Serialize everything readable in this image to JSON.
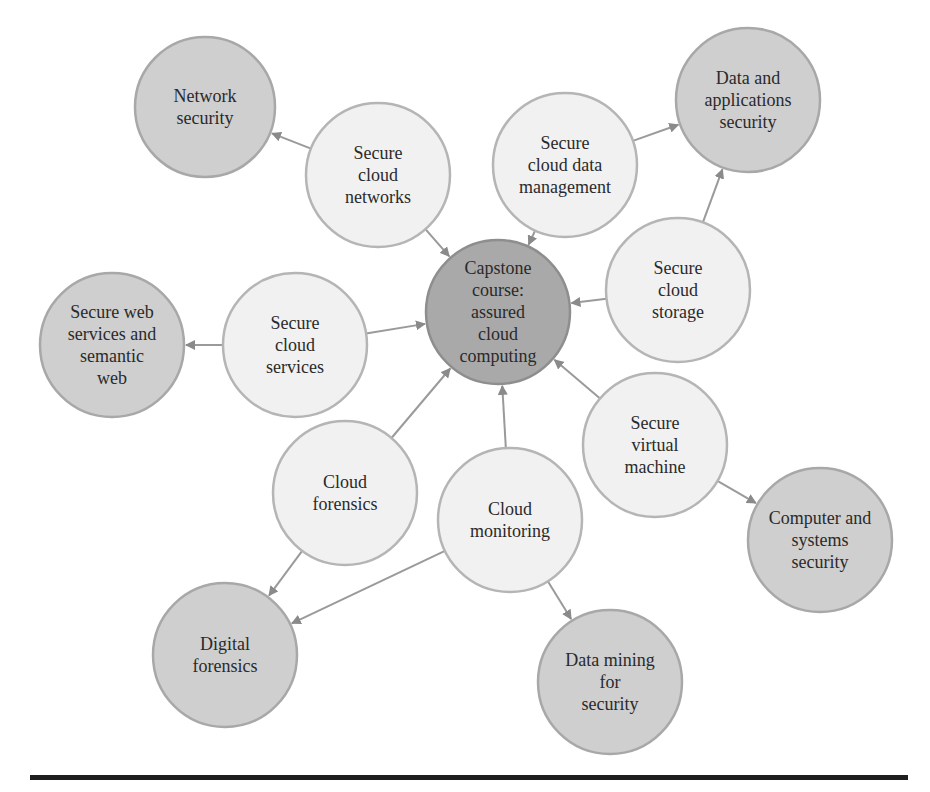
{
  "colors": {
    "center_fill": "#a9a9a9",
    "center_stroke": "#8e8e8e",
    "outer_fill": "#cfcfcf",
    "outer_stroke": "#a8a8a8",
    "middle_fill": "#f1f1f1",
    "middle_stroke": "#b5b5b5",
    "edge": "#9a9a9a",
    "rule": "#1e1e1e"
  },
  "nodes": [
    {
      "id": "capstone",
      "type": "center",
      "x": 498,
      "y": 312,
      "r": 72,
      "lines": [
        "Capstone",
        "course:",
        "assured",
        "cloud",
        "computing"
      ]
    },
    {
      "id": "secure-cloud-networks",
      "type": "middle",
      "x": 378,
      "y": 175,
      "r": 72,
      "lines": [
        "Secure",
        "cloud",
        "networks"
      ]
    },
    {
      "id": "secure-cloud-data-management",
      "type": "middle",
      "x": 565,
      "y": 165,
      "r": 72,
      "lines": [
        "Secure",
        "cloud data",
        "management"
      ]
    },
    {
      "id": "secure-cloud-storage",
      "type": "middle",
      "x": 678,
      "y": 290,
      "r": 72,
      "lines": [
        "Secure",
        "cloud",
        "storage"
      ]
    },
    {
      "id": "secure-cloud-services",
      "type": "middle",
      "x": 295,
      "y": 345,
      "r": 72,
      "lines": [
        "Secure",
        "cloud",
        "services"
      ]
    },
    {
      "id": "secure-virtual-machine",
      "type": "middle",
      "x": 655,
      "y": 445,
      "r": 72,
      "lines": [
        "Secure",
        "virtual",
        "machine"
      ]
    },
    {
      "id": "cloud-forensics",
      "type": "middle",
      "x": 345,
      "y": 493,
      "r": 72,
      "lines": [
        "Cloud",
        "forensics"
      ]
    },
    {
      "id": "cloud-monitoring",
      "type": "middle",
      "x": 510,
      "y": 520,
      "r": 72,
      "lines": [
        "Cloud",
        "monitoring"
      ]
    },
    {
      "id": "network-security",
      "type": "outer",
      "x": 205,
      "y": 107,
      "r": 70,
      "lines": [
        "Network",
        "security"
      ]
    },
    {
      "id": "data-and-applications-security",
      "type": "outer",
      "x": 748,
      "y": 100,
      "r": 72,
      "lines": [
        "Data and",
        "applications",
        "security"
      ]
    },
    {
      "id": "secure-web-services-and-semantic-web",
      "type": "outer",
      "x": 112,
      "y": 345,
      "r": 72,
      "lines": [
        "Secure web",
        "services and",
        "semantic",
        "web"
      ]
    },
    {
      "id": "computer-and-systems-security",
      "type": "outer",
      "x": 820,
      "y": 540,
      "r": 72,
      "lines": [
        "Computer and",
        "systems",
        "security"
      ]
    },
    {
      "id": "digital-forensics",
      "type": "outer",
      "x": 225,
      "y": 655,
      "r": 72,
      "lines": [
        "Digital",
        "forensics"
      ]
    },
    {
      "id": "data-mining-for-security",
      "type": "outer",
      "x": 610,
      "y": 682,
      "r": 72,
      "lines": [
        "Data mining",
        "for",
        "security"
      ]
    }
  ],
  "edges": [
    {
      "from": "secure-cloud-networks",
      "to": "capstone"
    },
    {
      "from": "secure-cloud-data-management",
      "to": "capstone"
    },
    {
      "from": "secure-cloud-storage",
      "to": "capstone"
    },
    {
      "from": "secure-cloud-services",
      "to": "capstone"
    },
    {
      "from": "secure-virtual-machine",
      "to": "capstone"
    },
    {
      "from": "cloud-forensics",
      "to": "capstone"
    },
    {
      "from": "cloud-monitoring",
      "to": "capstone"
    },
    {
      "from": "secure-cloud-networks",
      "to": "network-security"
    },
    {
      "from": "secure-cloud-data-management",
      "to": "data-and-applications-security"
    },
    {
      "from": "secure-cloud-storage",
      "to": "data-and-applications-security"
    },
    {
      "from": "secure-cloud-services",
      "to": "secure-web-services-and-semantic-web"
    },
    {
      "from": "secure-virtual-machine",
      "to": "computer-and-systems-security"
    },
    {
      "from": "cloud-forensics",
      "to": "digital-forensics"
    },
    {
      "from": "cloud-monitoring",
      "to": "digital-forensics"
    },
    {
      "from": "cloud-monitoring",
      "to": "data-mining-for-security"
    }
  ]
}
